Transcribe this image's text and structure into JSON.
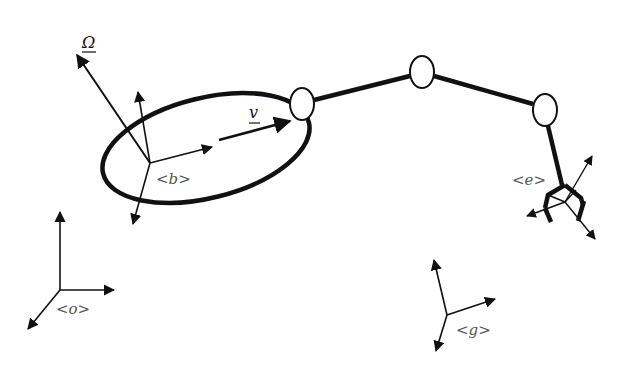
{
  "diagram": {
    "type": "robot-arm-kinematics",
    "labels": {
      "omega": "Ω",
      "velocity": "v",
      "body_frame": "<b>",
      "end_effector_frame": "<e>",
      "origin_frame": "<o>",
      "goal_frame": "<g>"
    },
    "colors": {
      "stroke": "#111111",
      "label": "#555555",
      "background": "#ffffff"
    },
    "joints": [
      {
        "name": "joint-1",
        "cx": 302,
        "cy": 104
      },
      {
        "name": "joint-2",
        "cx": 422,
        "cy": 72
      },
      {
        "name": "joint-3",
        "cx": 545,
        "cy": 110
      }
    ]
  }
}
